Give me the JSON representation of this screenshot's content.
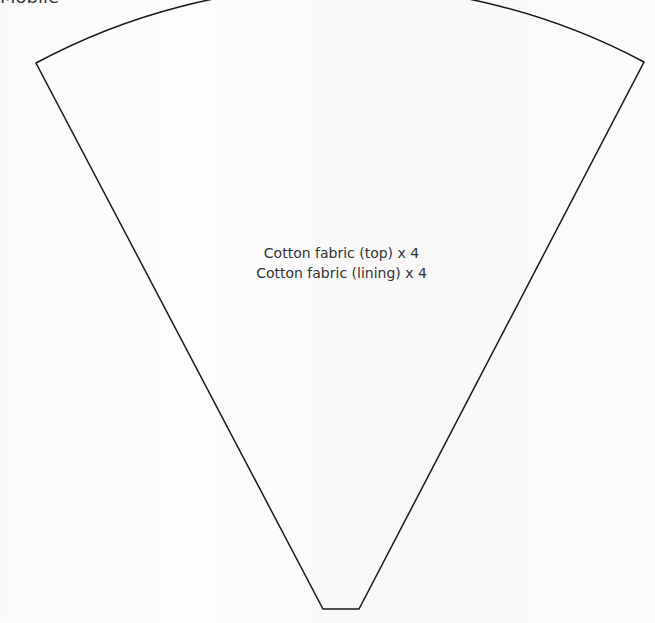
{
  "page": {
    "section_label": "Mobile"
  },
  "pattern_piece": {
    "shape": "wedge",
    "stroke_color": "#1a1a1a",
    "corners": {
      "top_left": [
        36,
        63
      ],
      "top_right": [
        644,
        62
      ],
      "bottom_left": [
        323,
        609
      ],
      "bottom_right": [
        359,
        609
      ]
    },
    "labels": [
      "Cotton fabric (top) x 4",
      "Cotton fabric (lining) x 4"
    ]
  }
}
